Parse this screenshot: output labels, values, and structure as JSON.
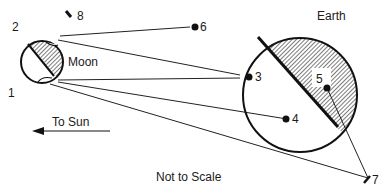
{
  "diagram": {
    "bodies": {
      "earth": {
        "label": "Earth"
      },
      "moon": {
        "label": "Moon"
      }
    },
    "points": [
      {
        "id": "1",
        "label": "1"
      },
      {
        "id": "2",
        "label": "2"
      },
      {
        "id": "3",
        "label": "3"
      },
      {
        "id": "4",
        "label": "4"
      },
      {
        "id": "5",
        "label": "5"
      },
      {
        "id": "6",
        "label": "6"
      },
      {
        "id": "7",
        "label": "7"
      },
      {
        "id": "8",
        "label": "8"
      }
    ],
    "sun_direction": {
      "label": "To Sun"
    },
    "note": "Not to Scale"
  }
}
